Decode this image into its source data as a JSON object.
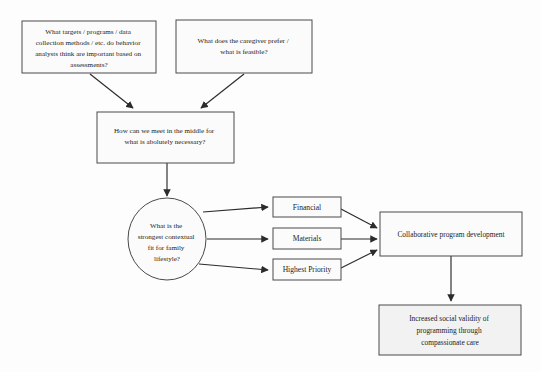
{
  "diagram": {
    "type": "flowchart",
    "orientation": "top-to-bottom-then-left-to-right",
    "background_color": "#fdfdfd",
    "node_fill_color": "#fbfbfb",
    "node_shaded_fill_color": "#f2f2f2",
    "node_border_color": "#4a4a4a",
    "connector_color": "#2b2b2b",
    "text_color": "#1c1c1c"
  },
  "nodes": {
    "question_behavior_analysts": {
      "shape": "rectangle",
      "lines": [
        "What targets / programs / data",
        "collection methods / etc. do behavior",
        "analysts think are important based on",
        "assessments?"
      ]
    },
    "question_caregiver": {
      "shape": "rectangle",
      "lines": [
        "What does the caregiver prefer /",
        "what is feasible?"
      ]
    },
    "meet_in_middle": {
      "shape": "rectangle",
      "lines": [
        "How can we meet in the middle for",
        "what is abolutely necessary?"
      ]
    },
    "contextual_fit": {
      "shape": "ellipse",
      "lines": [
        "What is the",
        "strongest contextual",
        "fit for family",
        "lifestyle?"
      ]
    },
    "financial": {
      "shape": "rectangle",
      "lines": [
        "Financial"
      ]
    },
    "materials": {
      "shape": "rectangle",
      "lines": [
        "Materials"
      ]
    },
    "highest_priority": {
      "shape": "rectangle",
      "lines": [
        "Highest Priority"
      ]
    },
    "collaborative_program": {
      "shape": "rectangle",
      "lines": [
        "Collaborative program development"
      ]
    },
    "social_validity": {
      "shape": "rectangle",
      "lines": [
        "Increased social validity of",
        "programming through",
        "compassionate care"
      ]
    }
  },
  "edges": [
    {
      "from": "question_behavior_analysts",
      "to": "meet_in_middle",
      "style": "arrow"
    },
    {
      "from": "question_caregiver",
      "to": "meet_in_middle",
      "style": "arrow"
    },
    {
      "from": "meet_in_middle",
      "to": "contextual_fit",
      "style": "arrow"
    },
    {
      "from": "contextual_fit",
      "to": "financial",
      "style": "arrow"
    },
    {
      "from": "contextual_fit",
      "to": "materials",
      "style": "arrow"
    },
    {
      "from": "contextual_fit",
      "to": "highest_priority",
      "style": "arrow"
    },
    {
      "from": "financial",
      "to": "collaborative_program",
      "style": "arrow"
    },
    {
      "from": "materials",
      "to": "collaborative_program",
      "style": "arrow"
    },
    {
      "from": "highest_priority",
      "to": "collaborative_program",
      "style": "arrow"
    },
    {
      "from": "collaborative_program",
      "to": "social_validity",
      "style": "arrow"
    }
  ]
}
